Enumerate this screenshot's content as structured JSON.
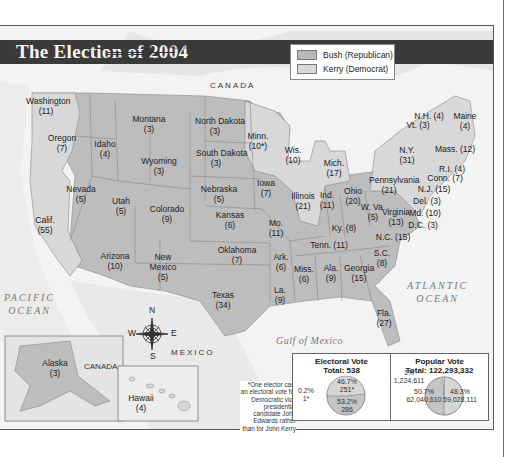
{
  "title": "The Election of 2004",
  "legend": [
    {
      "label": "Bush (Republican)",
      "color": "#b9b9b9"
    },
    {
      "label": "Kerry (Democrat)",
      "color": "#d9d9d9"
    }
  ],
  "scale": {
    "miles": [
      "0",
      "200",
      "400 mi."
    ],
    "km": [
      "0",
      "200",
      "400 km"
    ]
  },
  "labels": {
    "canada_top": "CANADA",
    "canada_inset": "CANADA",
    "mexico": "MEXICO",
    "pacific": "PACIFIC\nOCEAN",
    "atlantic": "ATLANTIC\nOCEAN",
    "gulf": "Gulf of Mexico"
  },
  "compass": {
    "n": "N",
    "s": "S",
    "e": "E",
    "w": "W"
  },
  "states": [
    {
      "name": "Washington",
      "votes": "(11)",
      "winner": "Kerry",
      "x": 46,
      "y": 104
    },
    {
      "name": "Oregon",
      "votes": "(7)",
      "winner": "Kerry",
      "x": 62,
      "y": 141
    },
    {
      "name": "Idaho",
      "votes": "(4)",
      "winner": "Bush",
      "x": 105,
      "y": 147
    },
    {
      "name": "Montana",
      "votes": "(3)",
      "winner": "Bush",
      "x": 149,
      "y": 122
    },
    {
      "name": "North Dakota",
      "votes": "(3)",
      "winner": "Bush",
      "x": 215,
      "y": 124
    },
    {
      "name": "South Dakota",
      "votes": "(3)",
      "winner": "Bush",
      "x": 216,
      "y": 156
    },
    {
      "name": "Minn.",
      "votes": "(10*)",
      "winner": "Kerry",
      "x": 258,
      "y": 139
    },
    {
      "name": "Wyoming",
      "votes": "(3)",
      "winner": "Bush",
      "x": 159,
      "y": 164
    },
    {
      "name": "Wis.",
      "votes": "(10)",
      "winner": "Kerry",
      "x": 293,
      "y": 153
    },
    {
      "name": "Mich.",
      "votes": "(17)",
      "winner": "Kerry",
      "x": 334,
      "y": 166
    },
    {
      "name": "Iowa",
      "votes": "(7)",
      "winner": "Bush",
      "x": 266,
      "y": 186
    },
    {
      "name": "Nebraska",
      "votes": "(5)",
      "winner": "Bush",
      "x": 219,
      "y": 192
    },
    {
      "name": "Nevada",
      "votes": "(5)",
      "winner": "Bush",
      "x": 81,
      "y": 192
    },
    {
      "name": "Utah",
      "votes": "(5)",
      "winner": "Bush",
      "x": 121,
      "y": 204
    },
    {
      "name": "Colorado",
      "votes": "(9)",
      "winner": "Bush",
      "x": 167,
      "y": 212
    },
    {
      "name": "Kansas",
      "votes": "(6)",
      "winner": "Bush",
      "x": 230,
      "y": 218
    },
    {
      "name": "Illinois",
      "votes": "(21)",
      "winner": "Kerry",
      "x": 303,
      "y": 199
    },
    {
      "name": "Ind.",
      "votes": "(11)",
      "winner": "Bush",
      "x": 327,
      "y": 198
    },
    {
      "name": "Ohio",
      "votes": "(20)",
      "winner": "Bush",
      "x": 353,
      "y": 194
    },
    {
      "name": "Pennsylvania",
      "votes": "(21)",
      "winner": "Kerry",
      "x": 389,
      "y": 183
    },
    {
      "name": "Mo.",
      "votes": "(11)",
      "winner": "Bush",
      "x": 276,
      "y": 226
    },
    {
      "name": "Calif.",
      "votes": "(55)",
      "winner": "Kerry",
      "x": 45,
      "y": 223
    },
    {
      "name": "W. Va.",
      "votes": "(5)",
      "winner": "Bush",
      "x": 373,
      "y": 210
    },
    {
      "name": "Virginia",
      "votes": "(13)",
      "winner": "Bush",
      "x": 396,
      "y": 215
    },
    {
      "name": "Ky. (8)",
      "votes": "",
      "winner": "Bush",
      "x": 344,
      "y": 231
    },
    {
      "name": "Arizona",
      "votes": "(10)",
      "winner": "Bush",
      "x": 115,
      "y": 259
    },
    {
      "name": "New\nMexico",
      "votes": "(5)",
      "winner": "Bush",
      "x": 163,
      "y": 260
    },
    {
      "name": "Oklahoma",
      "votes": "(7)",
      "winner": "Bush",
      "x": 237,
      "y": 253
    },
    {
      "name": "Tenn. (11)",
      "votes": "",
      "winner": "Bush",
      "x": 329,
      "y": 248
    },
    {
      "name": "N.C. (15)",
      "votes": "",
      "winner": "Bush",
      "x": 393,
      "y": 240
    },
    {
      "name": "Ark.",
      "votes": "(6)",
      "winner": "Bush",
      "x": 281,
      "y": 260
    },
    {
      "name": "S.C.",
      "votes": "(8)",
      "winner": "Bush",
      "x": 382,
      "y": 256
    },
    {
      "name": "Miss.",
      "votes": "(6)",
      "winner": "Bush",
      "x": 304,
      "y": 272
    },
    {
      "name": "Ala.",
      "votes": "(9)",
      "winner": "Bush",
      "x": 331,
      "y": 271
    },
    {
      "name": "Georgia",
      "votes": "(15)",
      "winner": "Bush",
      "x": 359,
      "y": 271
    },
    {
      "name": "Texas",
      "votes": "(34)",
      "winner": "Bush",
      "x": 223,
      "y": 298
    },
    {
      "name": "La.",
      "votes": "(9)",
      "winner": "Bush",
      "x": 280,
      "y": 293
    },
    {
      "name": "Fla.",
      "votes": "(27)",
      "winner": "Bush",
      "x": 384,
      "y": 316
    },
    {
      "name": "Alaska",
      "votes": "(3)",
      "winner": "Bush",
      "x": 55,
      "y": 366
    },
    {
      "name": "Hawaii",
      "votes": "(4)",
      "winner": "Kerry",
      "x": 141,
      "y": 401
    }
  ],
  "ne_states": [
    {
      "label": "N.H. (4)",
      "winner": "Kerry",
      "x": 426,
      "y": 116
    },
    {
      "label": "Maine\n(4)",
      "winner": "Kerry",
      "x": 462,
      "y": 116
    },
    {
      "label": "Vt. (3)",
      "winner": "Kerry",
      "x": 415,
      "y": 125
    },
    {
      "label": "N.Y.\n(31)",
      "winner": "Kerry",
      "x": 404,
      "y": 150
    },
    {
      "label": "Mass. (12)",
      "winner": "Kerry",
      "x": 452,
      "y": 149
    },
    {
      "label": "R.I. (4)",
      "winner": "Kerry",
      "x": 449,
      "y": 169
    },
    {
      "label": "Conn. (7)",
      "winner": "Kerry",
      "x": 442,
      "y": 178
    },
    {
      "label": "N.J. (15)",
      "winner": "Kerry",
      "x": 431,
      "y": 189
    },
    {
      "label": "Del. (3)",
      "winner": "Kerry",
      "x": 424,
      "y": 201
    },
    {
      "label": "Md. (10)",
      "winner": "Kerry",
      "x": 422,
      "y": 213
    },
    {
      "label": "D.C. (3)",
      "winner": "Kerry",
      "x": 420,
      "y": 225
    }
  ],
  "chart_data": [
    {
      "type": "pie",
      "title": "Electoral Vote",
      "subtitle": "Total: 538",
      "categories": [
        "Bush (Republican)",
        "Kerry (Democrat)",
        "John Edwards"
      ],
      "values": [
        286,
        251,
        1
      ],
      "percent": [
        53.2,
        46.7,
        0.2
      ],
      "labels": [
        "53.2%\n286",
        "46.7%\n251*",
        "0.2%\n1*"
      ]
    },
    {
      "type": "pie",
      "title": "Popular Vote",
      "subtitle": "Total: 122,293,332",
      "categories": [
        "Bush (Republican)",
        "Kerry (Democrat)",
        "Other"
      ],
      "values": [
        62040610,
        59028111,
        1224611
      ],
      "percent": [
        50.7,
        48.3,
        1
      ],
      "labels": [
        "50.7%\n62,040,610",
        "48.3%\n59,028,111",
        "1%\n1,224,611"
      ]
    }
  ],
  "footnote": "*One elector cast an electoral vote for Democratic vice presidential candidate John Edwards rather than for John Kerry"
}
